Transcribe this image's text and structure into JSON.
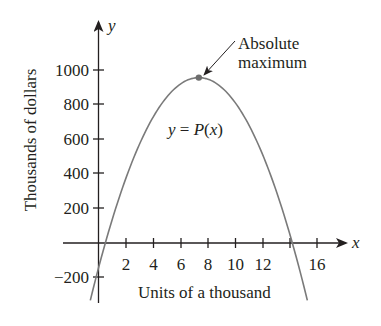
{
  "chart_data": {
    "type": "line",
    "title": "",
    "xlabel": "Units of a thousand",
    "ylabel": "Thousands of dollars",
    "x_axis_symbol": "x",
    "y_axis_symbol": "y",
    "x_ticks": [
      2,
      4,
      6,
      8,
      10,
      12,
      14,
      16
    ],
    "x_tick_labels": [
      "2",
      "4",
      "6",
      "8",
      "10",
      "12",
      "",
      "16"
    ],
    "y_ticks": [
      -200,
      200,
      400,
      600,
      800,
      1000
    ],
    "y_tick_labels": [
      "−200",
      "200",
      "400",
      "600",
      "800",
      "1000"
    ],
    "xlim": [
      -2.6,
      18
    ],
    "ylim": [
      -340,
      1270
    ],
    "grid": false,
    "legend": null,
    "series": [
      {
        "name": "y = P(x)",
        "description": "Downward-opening parabola (profit function)",
        "x": [
          -0.6,
          0,
          0.5,
          2,
          4,
          6,
          7.35,
          8,
          10,
          12,
          14.2,
          15.3
        ],
        "y": [
          -330,
          -145,
          0,
          373,
          727,
          919,
          956,
          947,
          813,
          516,
          0,
          -330
        ]
      }
    ],
    "annotations": [
      {
        "text_line1": "Absolute",
        "text_line2": "maximum",
        "points_to": {
          "x": 7.35,
          "y": 956
        }
      },
      {
        "text": "y = P(x)",
        "label_parts": {
          "lhs": "y",
          "eq": " = ",
          "fn": "P",
          "open": "(",
          "arg": "x",
          "close": ")"
        }
      }
    ],
    "max_point": {
      "x": 7.35,
      "y": 956
    }
  }
}
